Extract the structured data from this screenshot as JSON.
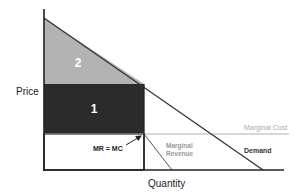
{
  "diagram": {
    "axes": {
      "y_label": "Price",
      "x_label": "Quantity"
    },
    "regions": [
      {
        "id": "2",
        "label": "2",
        "color": "#b3b3b3"
      },
      {
        "id": "1",
        "label": "1",
        "color": "#2b2b2b"
      }
    ],
    "curves": {
      "marginal_cost": {
        "label": "Marginal Cost",
        "color": "#aaaaaa"
      },
      "marginal_revenue": {
        "label_line1": "Marginal",
        "label_line2": "Revenue",
        "color": "#999999"
      },
      "demand": {
        "label": "Demand",
        "color": "#333333"
      }
    },
    "annotation": {
      "label": "MR = MC"
    },
    "colors": {
      "axis": "#222222",
      "box_border": "#222222",
      "text_dark": "#222222",
      "text_light": "#ffffff"
    }
  }
}
